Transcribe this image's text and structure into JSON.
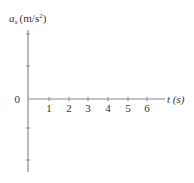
{
  "diagram": {
    "type": "blank-graph-axes",
    "y_axis": {
      "label_symbol": "a",
      "label_subscript": "x",
      "label_units": "(m/s",
      "label_units_exp": "2",
      "label_units_close": ")",
      "origin_label": "0",
      "tick_count_above": 2,
      "tick_count_below": 2
    },
    "x_axis": {
      "label": "t (s)",
      "ticks": [
        "1",
        "2",
        "3",
        "4",
        "5",
        "6"
      ]
    },
    "colors": {
      "axis": "#888888",
      "text": "#333333"
    }
  }
}
